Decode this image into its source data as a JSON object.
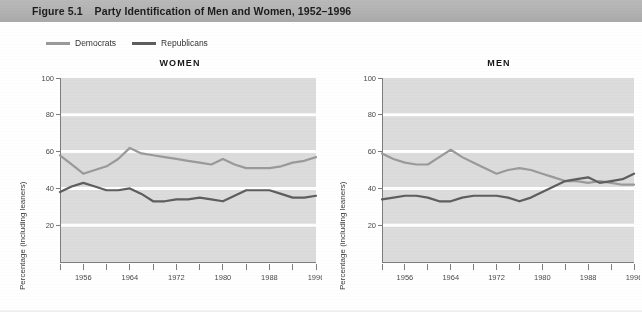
{
  "figure": {
    "number": "Figure 5.1",
    "title": "Party Identification of Men and Women, 1952–1996"
  },
  "legend": {
    "position": "top-left",
    "items": [
      {
        "label": "Democrats",
        "color": "#9a9a9a"
      },
      {
        "label": "Republicans",
        "color": "#5e5e5e"
      }
    ]
  },
  "colors": {
    "democrat_line": "#9a9a9a",
    "republican_line": "#5e5e5e",
    "plot_background": "#dcdcdc",
    "gridline": "#ffffff",
    "axis": "#7d7d7d",
    "titlebar": "#b2b2b2"
  },
  "axes": {
    "ylabel": "Percentage (including leaners)",
    "ylim": [
      0,
      100
    ],
    "yticks": [
      20,
      40,
      60,
      80,
      100
    ],
    "yticklabels": [
      "20",
      "40",
      "60",
      "80",
      "100"
    ],
    "xlim": [
      1952,
      1996
    ],
    "xticks": [
      1952,
      1956,
      1960,
      1964,
      1968,
      1972,
      1976,
      1980,
      1984,
      1988,
      1992,
      1996
    ],
    "xticklabels": [
      "",
      "1956",
      "",
      "1964",
      "",
      "1972",
      "",
      "1980",
      "",
      "1988",
      "",
      "1996"
    ],
    "grid": "horizontal-white"
  },
  "chart_data": [
    {
      "type": "line",
      "title": "WOMEN",
      "xlabel": "",
      "ylabel": "Percentage (including leaners)",
      "ylim": [
        0,
        100
      ],
      "xlim": [
        1952,
        1996
      ],
      "x": [
        1952,
        1954,
        1956,
        1958,
        1960,
        1962,
        1964,
        1966,
        1968,
        1970,
        1972,
        1974,
        1976,
        1978,
        1980,
        1982,
        1984,
        1986,
        1988,
        1990,
        1992,
        1994,
        1996
      ],
      "series": [
        {
          "name": "Democrats",
          "color": "#9a9a9a",
          "values": [
            58,
            53,
            48,
            50,
            52,
            56,
            62,
            59,
            58,
            57,
            56,
            55,
            54,
            53,
            56,
            53,
            51,
            51,
            51,
            52,
            54,
            55,
            57
          ]
        },
        {
          "name": "Republicans",
          "color": "#5e5e5e",
          "values": [
            38,
            41,
            43,
            41,
            39,
            39,
            40,
            37,
            33,
            33,
            34,
            34,
            35,
            34,
            33,
            36,
            39,
            39,
            39,
            37,
            35,
            35,
            36
          ]
        }
      ]
    },
    {
      "type": "line",
      "title": "MEN",
      "xlabel": "",
      "ylabel": "Percentage (including leaners)",
      "ylim": [
        0,
        100
      ],
      "xlim": [
        1952,
        1996
      ],
      "x": [
        1952,
        1954,
        1956,
        1958,
        1960,
        1962,
        1964,
        1966,
        1968,
        1970,
        1972,
        1974,
        1976,
        1978,
        1980,
        1982,
        1984,
        1986,
        1988,
        1990,
        1992,
        1994,
        1996
      ],
      "series": [
        {
          "name": "Democrats",
          "color": "#9a9a9a",
          "values": [
            59,
            56,
            54,
            53,
            53,
            57,
            61,
            57,
            54,
            51,
            48,
            50,
            51,
            50,
            48,
            46,
            44,
            44,
            43,
            44,
            43,
            42,
            42
          ]
        },
        {
          "name": "Republicans",
          "color": "#5e5e5e",
          "values": [
            34,
            35,
            36,
            36,
            35,
            33,
            33,
            35,
            36,
            36,
            36,
            35,
            33,
            35,
            38,
            41,
            44,
            45,
            46,
            43,
            44,
            45,
            48
          ]
        }
      ]
    }
  ]
}
